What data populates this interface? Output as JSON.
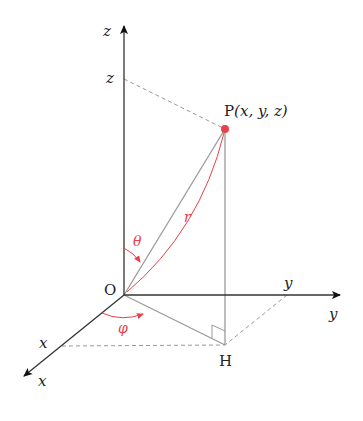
{
  "diagram": {
    "colors": {
      "axis": "#333333",
      "line": "#999999",
      "dash": "#999999",
      "accent": "#e8414a"
    },
    "labels": {
      "z_axis": "z",
      "z_tick": "z",
      "y_axis": "y",
      "y_tick": "y",
      "x_axis": "x",
      "x_tick": "x",
      "origin": "O",
      "point": "P",
      "point_coords": "(x, y, z)",
      "foot": "H",
      "theta": "θ",
      "phi": "φ",
      "radius": "r"
    },
    "points": {
      "O": [
        124,
        295
      ],
      "P": [
        225,
        129
      ],
      "H": [
        225,
        345
      ],
      "z_tick": [
        124,
        79
      ],
      "y_tick": [
        287,
        295
      ],
      "x_tick": [
        62,
        346
      ]
    }
  }
}
